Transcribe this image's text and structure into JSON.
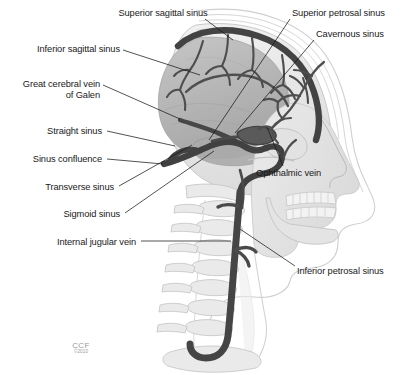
{
  "figure": {
    "background_color": "#ffffff",
    "vessel_color": "#4a4a4a",
    "brain_color": "#b9b9b9",
    "bone_color": "#e6e6e6",
    "leader_color": "#1a1a1a",
    "label_color": "#1a1a1a"
  },
  "labels": [
    {
      "id": "superior-sagittal-sinus",
      "text": "Superior sagittal sinus",
      "align": "center",
      "x": 83,
      "y": 8,
      "line": {
        "x1": 205,
        "y1": 19,
        "x2": 233,
        "y2": 40
      }
    },
    {
      "id": "inferior-sagittal-sinus",
      "text": "Inferior sagittal sinus",
      "align": "right",
      "x": 8,
      "y": 44,
      "line": {
        "x1": 123,
        "y1": 50,
        "x2": 200,
        "y2": 75
      }
    },
    {
      "id": "great-cerebral-vein-of-galen",
      "text": "Great cerebral vein",
      "text2": "of Galen",
      "align": "right",
      "x": 6,
      "y": 79,
      "line": {
        "x1": 103,
        "y1": 85,
        "x2": 180,
        "y2": 119
      }
    },
    {
      "id": "straight-sinus",
      "text": "Straight sinus",
      "align": "right",
      "x": 36,
      "y": 126,
      "line": {
        "x1": 107,
        "y1": 131,
        "x2": 175,
        "y2": 146
      }
    },
    {
      "id": "sinus-confluence",
      "text": "Sinus confluence",
      "align": "right",
      "x": 18,
      "y": 154,
      "line": {
        "x1": 107,
        "y1": 159,
        "x2": 163,
        "y2": 164
      }
    },
    {
      "id": "transverse-sinus",
      "text": "Transverse sinus",
      "align": "right",
      "x": 30,
      "y": 182,
      "line": {
        "x1": 119,
        "y1": 186,
        "x2": 192,
        "y2": 145
      }
    },
    {
      "id": "sigmoid-sinus",
      "text": "Sigmoid sinus",
      "align": "right",
      "x": 57,
      "y": 209,
      "line": {
        "x1": 125,
        "y1": 213,
        "x2": 214,
        "y2": 151
      }
    },
    {
      "id": "internal-jugular-vein",
      "text": "Internal jugular vein",
      "align": "right",
      "x": 45,
      "y": 237,
      "line": {
        "x1": 141,
        "y1": 241,
        "x2": 231,
        "y2": 241
      }
    },
    {
      "id": "superior-petrosal-sinus",
      "text": "Superior petrosal sinus",
      "align": "left",
      "x": 292,
      "y": 8,
      "line": {
        "x1": 290,
        "y1": 19,
        "x2": 209,
        "y2": 140
      }
    },
    {
      "id": "cavernous-sinus",
      "text": "Cavernous sinus",
      "align": "left",
      "x": 316,
      "y": 29,
      "line": {
        "x1": 314,
        "y1": 40,
        "x2": 235,
        "y2": 133
      }
    },
    {
      "id": "ophthalmic-vein",
      "text": "Ophthalmic vein",
      "align": "left",
      "x": 256,
      "y": 168,
      "line": {
        "x1": 283,
        "y1": 166,
        "x2": 267,
        "y2": 127
      }
    },
    {
      "id": "inferior-petrosal-sinus",
      "text": "Inferior petrosal sinus",
      "align": "left",
      "x": 297,
      "y": 266,
      "line": {
        "x1": 295,
        "y1": 266,
        "x2": 240,
        "y2": 229
      }
    }
  ],
  "credit": {
    "organization": "CCF",
    "copyright": "©2010",
    "x": 63,
    "y": 341
  }
}
